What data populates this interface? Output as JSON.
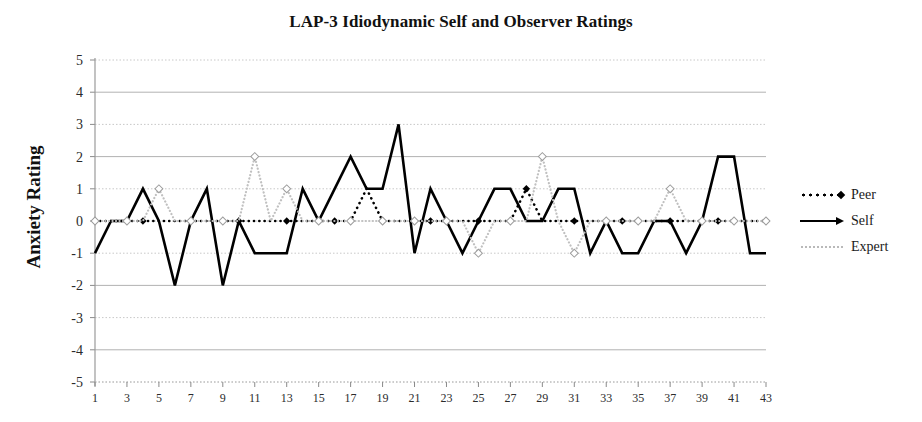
{
  "chart_data": {
    "type": "line",
    "title": "LAP-3 Idiodynamic Self and Observer Ratings",
    "xlabel": "",
    "ylabel": "Anxiety Rating",
    "ylim": [
      -5,
      5
    ],
    "xlim": [
      1,
      43
    ],
    "grid": true,
    "legend_position": "right",
    "ytick_labels": [
      "5",
      "4",
      "3",
      "2",
      "1",
      "0",
      "-1",
      "-2",
      "-3",
      "-4",
      "-5"
    ],
    "yticks": [
      5,
      4,
      3,
      2,
      1,
      0,
      -1,
      -2,
      -3,
      -4,
      -5
    ],
    "xtick_labels": [
      "1",
      "3",
      "5",
      "7",
      "9",
      "11",
      "13",
      "15",
      "17",
      "19",
      "21",
      "23",
      "25",
      "27",
      "29",
      "31",
      "33",
      "35",
      "37",
      "39",
      "41",
      "43"
    ],
    "xticks": [
      1,
      3,
      5,
      7,
      9,
      11,
      13,
      15,
      17,
      19,
      21,
      23,
      25,
      27,
      29,
      31,
      33,
      35,
      37,
      39,
      41,
      43
    ],
    "x": [
      1,
      2,
      3,
      4,
      5,
      6,
      7,
      8,
      9,
      10,
      11,
      12,
      13,
      14,
      15,
      16,
      17,
      18,
      19,
      20,
      21,
      22,
      23,
      24,
      25,
      26,
      27,
      28,
      29,
      30,
      31,
      32,
      33,
      34,
      35,
      36,
      37,
      38,
      39,
      40,
      41,
      42,
      43
    ],
    "series": [
      {
        "name": "Peer",
        "color": "#000000",
        "style": "dotted",
        "marker": "diamond",
        "values": [
          0,
          0,
          0,
          0,
          0,
          0,
          0,
          0,
          0,
          0,
          0,
          0,
          0,
          0,
          0,
          0,
          0,
          1,
          0,
          0,
          0,
          0,
          0,
          0,
          0,
          0,
          0,
          1,
          0,
          0,
          0,
          0,
          0,
          0,
          0,
          0,
          0,
          0,
          0,
          0,
          0,
          0,
          0
        ]
      },
      {
        "name": "Self",
        "color": "#000000",
        "style": "solid",
        "marker": "none",
        "values": [
          -1,
          0,
          0,
          1,
          0,
          -2,
          0,
          1,
          -2,
          0,
          -1,
          -1,
          -1,
          1,
          0,
          1,
          2,
          1,
          1,
          3,
          -1,
          1,
          0,
          -1,
          0,
          1,
          1,
          0,
          0,
          1,
          1,
          -1,
          0,
          -1,
          -1,
          0,
          0,
          -1,
          0,
          2,
          2,
          -1,
          -1
        ]
      },
      {
        "name": "Expert",
        "color": "#c0c0c0",
        "style": "dotted",
        "marker": "diamond-open",
        "values": [
          0,
          0,
          0,
          0,
          1,
          0,
          0,
          0,
          0,
          0,
          2,
          0,
          1,
          0,
          0,
          0,
          0,
          0,
          0,
          0,
          0,
          0,
          0,
          0,
          -1,
          0,
          0,
          0,
          2,
          0,
          -1,
          0,
          0,
          0,
          0,
          0,
          1,
          0,
          0,
          0,
          0,
          0,
          0
        ]
      }
    ]
  },
  "legend": {
    "items": [
      {
        "label": "Peer",
        "icon": "dotted-diamond-marker"
      },
      {
        "label": "Self",
        "icon": "solid-arrow-line"
      },
      {
        "label": "Expert",
        "icon": "light-dotted-line"
      }
    ]
  }
}
